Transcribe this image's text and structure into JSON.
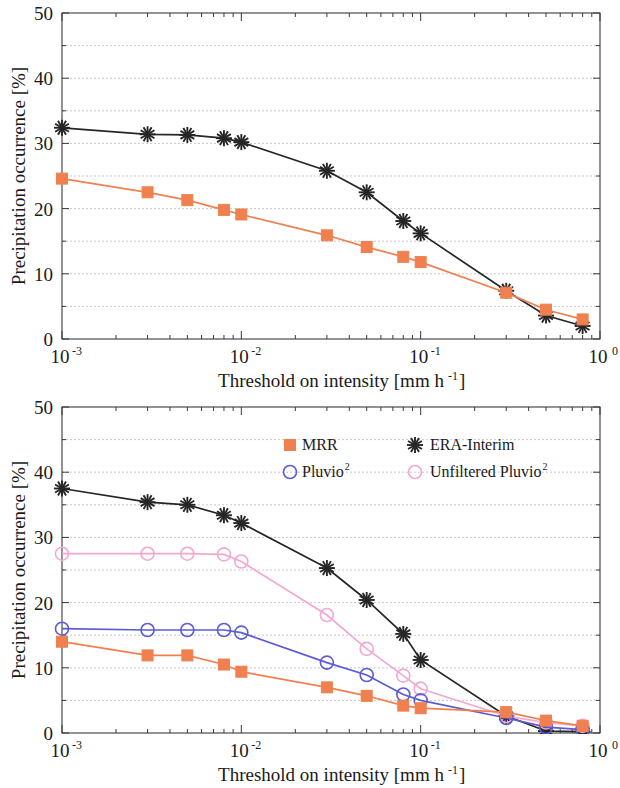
{
  "figure": {
    "panels": [
      {
        "id": "top",
        "name": "panel-top"
      },
      {
        "id": "bottom",
        "name": "panel-bottom"
      }
    ]
  },
  "axes": {
    "ylabel": "Precipitation occurrence [%]",
    "xlabel_main": "Threshold on intensity [mm h",
    "xlabel_exp": "-1",
    "xlabel_close": "]",
    "y_ticks": [
      "0",
      "10",
      "20",
      "30",
      "40",
      "50"
    ],
    "y_tick_values": [
      0,
      10,
      20,
      30,
      40,
      50
    ],
    "y_minor_values": [
      5,
      15,
      25,
      35,
      45
    ],
    "x_ticks": [
      {
        "mantissa": "10",
        "exp": "-3",
        "value": 0.001
      },
      {
        "mantissa": "10",
        "exp": "-2",
        "value": 0.01
      },
      {
        "mantissa": "10",
        "exp": "-1",
        "value": 0.1
      },
      {
        "mantissa": "10",
        "exp": "0",
        "value": 1
      }
    ],
    "ylim": [
      0,
      50
    ],
    "xlim": [
      0.001,
      1.0
    ],
    "xscale": "log"
  },
  "legend": {
    "position": "upper-center-of-bottom-panel",
    "entries": [
      {
        "label": "MRR",
        "exp": "",
        "marker": "filled-square",
        "color": "#F0804F"
      },
      {
        "label": "ERA-Interim",
        "exp": "",
        "marker": "asterisk",
        "color": "#262626"
      },
      {
        "label": "Pluvio",
        "exp": "2",
        "marker": "open-circle",
        "color": "#5B5BD6"
      },
      {
        "label": "Unfiltered Pluvio",
        "exp": "2",
        "marker": "open-circle",
        "color": "#F2A8D0"
      }
    ]
  },
  "colors": {
    "mrr": "#F0804F",
    "era_interim": "#262626",
    "pluvio2": "#5B5BD6",
    "unfiltered_pluvio2": "#F2A8D0",
    "grid": "#b9b9c4",
    "axis": "#3a3a3a",
    "background": "#ffffff"
  },
  "chart_data": [
    {
      "type": "line",
      "panel": "top",
      "title": "",
      "xlabel": "Threshold on intensity [mm h-1]",
      "ylabel": "Precipitation occurrence [%]",
      "xscale": "log",
      "xlim": [
        0.001,
        1.0
      ],
      "ylim": [
        0,
        50
      ],
      "grid": true,
      "legend": "none",
      "x": [
        0.001,
        0.003,
        0.005,
        0.008,
        0.01,
        0.03,
        0.05,
        0.08,
        0.1,
        0.3,
        0.5,
        0.8
      ],
      "series": [
        {
          "name": "ERA-Interim",
          "marker": "asterisk",
          "color": "#262626",
          "values": [
            32.4,
            31.4,
            31.3,
            30.8,
            30.2,
            25.8,
            22.5,
            18.1,
            16.2,
            7.4,
            3.6,
            2.0
          ]
        },
        {
          "name": "MRR",
          "marker": "filled-square",
          "color": "#F0804F",
          "values": [
            24.6,
            22.5,
            21.3,
            19.8,
            19.1,
            15.9,
            14.1,
            12.6,
            11.8,
            7.1,
            4.5,
            3.0
          ]
        }
      ]
    },
    {
      "type": "line",
      "panel": "bottom",
      "title": "",
      "xlabel": "Threshold on intensity [mm h-1]",
      "ylabel": "Precipitation occurrence [%]",
      "xscale": "log",
      "xlim": [
        0.001,
        1.0
      ],
      "ylim": [
        0,
        50
      ],
      "grid": true,
      "legend": "upper-center",
      "x": [
        0.001,
        0.003,
        0.005,
        0.008,
        0.01,
        0.03,
        0.05,
        0.08,
        0.1,
        0.3,
        0.5,
        0.8
      ],
      "series": [
        {
          "name": "ERA-Interim",
          "marker": "asterisk",
          "color": "#262626",
          "values": [
            37.5,
            35.4,
            35.0,
            33.4,
            32.2,
            25.3,
            20.4,
            15.2,
            11.2,
            2.6,
            0.3,
            0.2
          ]
        },
        {
          "name": "Unfiltered Pluvio2",
          "marker": "open-circle",
          "color": "#F2A8D0",
          "values": [
            27.5,
            27.5,
            27.5,
            27.4,
            26.3,
            18.1,
            12.9,
            8.8,
            6.8,
            2.6,
            1.6,
            1.1
          ]
        },
        {
          "name": "Pluvio2",
          "marker": "open-circle",
          "color": "#5B5BD6",
          "values": [
            16.0,
            15.8,
            15.8,
            15.8,
            15.4,
            10.8,
            8.9,
            5.9,
            5.0,
            2.3,
            0.9,
            0.5
          ]
        },
        {
          "name": "MRR",
          "marker": "filled-square",
          "color": "#F0804F",
          "values": [
            14.0,
            11.9,
            11.9,
            10.5,
            9.4,
            7.0,
            5.7,
            4.2,
            3.8,
            3.2,
            1.9,
            1.1
          ]
        }
      ]
    }
  ]
}
